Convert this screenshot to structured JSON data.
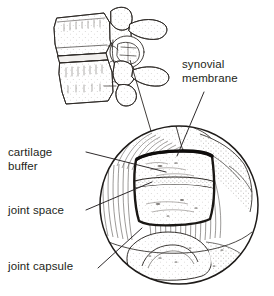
{
  "figure": {
    "background_color": "#ffffff",
    "ink_color": "#231f20",
    "line_color": "#2b2724",
    "fill_color": "#fdfdfc",
    "shade_color": "#e8e6e3"
  },
  "labels": {
    "synovial_membrane": {
      "line1": "synovial",
      "line2": "membrane"
    },
    "cartilage_buffer": {
      "line1": "cartilage",
      "line2": "buffer"
    },
    "joint_space": {
      "line1": "joint space"
    },
    "joint_capsule": {
      "line1": "joint capsule"
    }
  },
  "parts": {
    "vertebrae_diagram": "two-lumbar-vertebrae-lateral-view",
    "magnifier_circle": "magnified-facet-joint-detail",
    "connector": "callout-line-from-facet-to-magnifier"
  }
}
